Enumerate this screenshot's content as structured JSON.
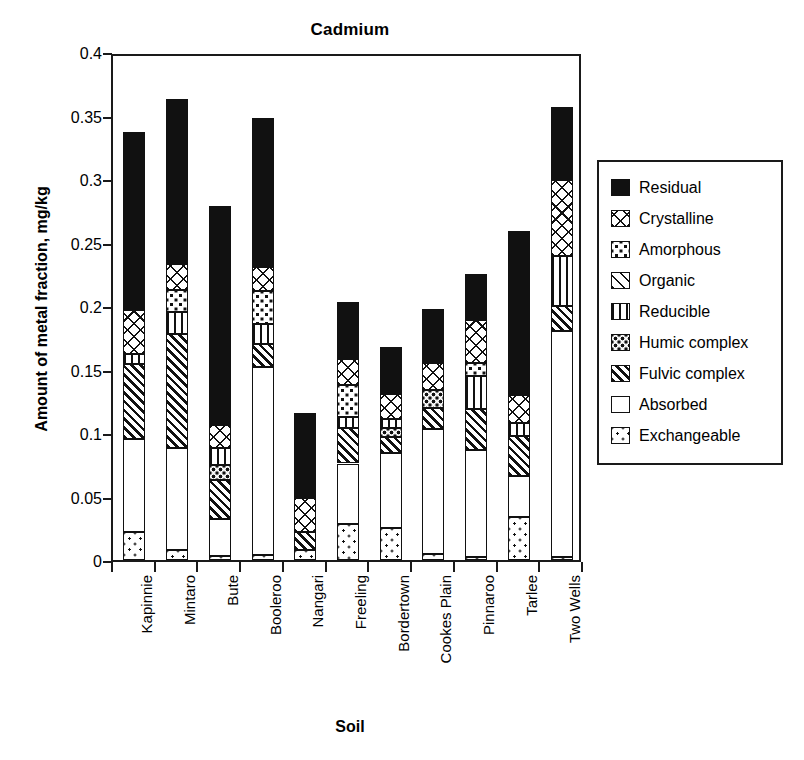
{
  "chart_data": {
    "type": "bar",
    "subtype": "stacked-vertical",
    "title": "Cadmium",
    "xlabel": "Soil",
    "ylabel": "Amount of metal fraction, mg/kg",
    "ylim": [
      0,
      0.4
    ],
    "yticks": [
      0,
      0.05,
      0.1,
      0.15,
      0.2,
      0.25,
      0.3,
      0.35,
      0.4
    ],
    "ytick_labels": [
      "0",
      "0.05",
      "0.1",
      "0.15",
      "0.2",
      "0.25",
      "0.3",
      "0.35",
      "0.4"
    ],
    "grid": false,
    "legend_position": "right",
    "categories": [
      "Kapinnie",
      "Mintaro",
      "Bute",
      "Booleroo",
      "Nangari",
      "Freeling",
      "Bordertown",
      "Cookes Plain",
      "Pinnaroo",
      "Tarlee",
      "Two Wells"
    ],
    "series": [
      {
        "name": "Exchangeable",
        "pattern": "fine-dots",
        "values": [
          0.022,
          0.008,
          0.003,
          0.004,
          0.008,
          0.028,
          0.025,
          0.005,
          0.002,
          0.034,
          0.002
        ]
      },
      {
        "name": "Absorbed",
        "pattern": "white",
        "values": [
          0.073,
          0.08,
          0.029,
          0.148,
          0.0,
          0.048,
          0.059,
          0.098,
          0.085,
          0.032,
          0.178
        ]
      },
      {
        "name": "Fulvic complex",
        "pattern": "diagonal-stripes",
        "values": [
          0.059,
          0.09,
          0.031,
          0.018,
          0.014,
          0.028,
          0.013,
          0.017,
          0.032,
          0.032,
          0.02
        ]
      },
      {
        "name": "Humic complex",
        "pattern": "coarse-dots",
        "values": [
          0.0,
          0.0,
          0.012,
          0.0,
          0.0,
          0.0,
          0.007,
          0.014,
          0.0,
          0.0,
          0.0
        ]
      },
      {
        "name": "Reducible",
        "pattern": "vertical-lines",
        "values": [
          0.008,
          0.017,
          0.013,
          0.016,
          0.0,
          0.009,
          0.007,
          0.0,
          0.026,
          0.01,
          0.039
        ]
      },
      {
        "name": "Organic",
        "pattern": "light-diagonal",
        "values": [
          0.0,
          0.0,
          0.0,
          0.0,
          0.0,
          0.0,
          0.0,
          0.0,
          0.0,
          0.0,
          0.0
        ]
      },
      {
        "name": "Amorphous",
        "pattern": "medium-dots",
        "values": [
          0.0,
          0.018,
          0.0,
          0.026,
          0.0,
          0.025,
          0.0,
          0.0,
          0.01,
          0.0,
          0.0
        ]
      },
      {
        "name": "Crystalline",
        "pattern": "cross-hatch",
        "values": [
          0.035,
          0.02,
          0.018,
          0.019,
          0.027,
          0.02,
          0.02,
          0.021,
          0.034,
          0.022,
          0.06
        ]
      },
      {
        "name": "Residual",
        "pattern": "solid-black",
        "values": [
          0.14,
          0.13,
          0.173,
          0.117,
          0.067,
          0.045,
          0.037,
          0.043,
          0.036,
          0.129,
          0.058
        ]
      }
    ],
    "totals": [
      0.337,
      0.363,
      0.279,
      0.348,
      0.116,
      0.203,
      0.168,
      0.198,
      0.225,
      0.288,
      0.357
    ]
  },
  "legend": {
    "items": [
      {
        "label": "Residual",
        "swatch": "solid-black-swatch"
      },
      {
        "label": "Crystalline",
        "swatch": "cross-hatch-swatch"
      },
      {
        "label": "Amorphous",
        "swatch": "medium-dots-swatch"
      },
      {
        "label": "Organic",
        "swatch": "light-diagonal-swatch"
      },
      {
        "label": "Reducible",
        "swatch": "vertical-lines-swatch"
      },
      {
        "label": "Humic complex",
        "swatch": "coarse-dots-swatch"
      },
      {
        "label": "Fulvic complex",
        "swatch": "diagonal-stripes-swatch"
      },
      {
        "label": "Absorbed",
        "swatch": "white-swatch"
      },
      {
        "label": "Exchangeable",
        "swatch": "fine-dots-swatch"
      }
    ]
  },
  "colors": {
    "ink": "#111111",
    "axis": "#1a1a1a",
    "background": "#ffffff"
  }
}
